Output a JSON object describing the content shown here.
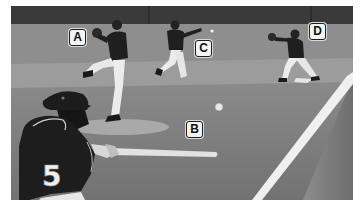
{
  "image": {
    "description": "Grayscale baseball photo: batter number 5 swinging in foreground, pitcher in wind-up, infielder throwing, first baseman stretching to catch",
    "colors": {
      "wall": "#3a3a3a",
      "field": "#7d7d7d",
      "infield_dirt": "#9a9a9a",
      "mound": "#a8a8a8",
      "foul_line": "#f2f2f2",
      "uniform": "#1f1f1f",
      "label_bg": "#f4f4f4",
      "label_border": "#1e1e1e"
    }
  },
  "labels": [
    {
      "id": "A",
      "text": "A",
      "target": "pitcher"
    },
    {
      "id": "B",
      "text": "B",
      "target": "ball-in-flight"
    },
    {
      "id": "C",
      "text": "C",
      "target": "throwing-fielder"
    },
    {
      "id": "D",
      "text": "D",
      "target": "first-baseman"
    }
  ],
  "batter": {
    "jersey_number": "5"
  }
}
